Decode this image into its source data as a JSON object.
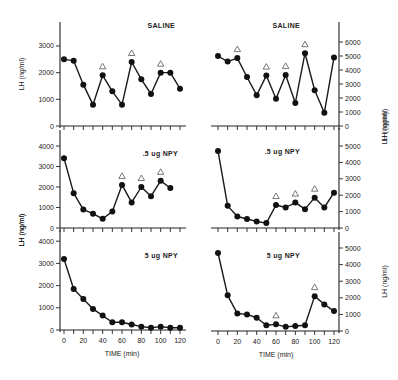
{
  "chart_data": [
    {
      "type": "line",
      "panel": "top-left",
      "label": "SALINE",
      "xlabel": "",
      "ylabel": "LH (ng/ml)",
      "y_axis_side": "left",
      "x": [
        0,
        10,
        20,
        30,
        40,
        50,
        60,
        70,
        80,
        90,
        100,
        110,
        120
      ],
      "values": [
        2500,
        2450,
        1550,
        800,
        1900,
        1300,
        800,
        2400,
        1750,
        1200,
        2000,
        2000,
        1400
      ],
      "pulse_markers_at": [
        40,
        70,
        100
      ],
      "yticks": [
        0,
        1000,
        2000,
        3000
      ],
      "ylim": [
        0,
        3600
      ],
      "xlim": [
        0,
        120
      ]
    },
    {
      "type": "line",
      "panel": "top-right",
      "label": "SALINE",
      "xlabel": "",
      "ylabel": "LH (ng/ml)",
      "y_axis_side": "right",
      "x": [
        0,
        10,
        20,
        30,
        40,
        50,
        60,
        70,
        80,
        90,
        100,
        110,
        120
      ],
      "values": [
        5000,
        4600,
        4850,
        3500,
        2200,
        3600,
        1950,
        3650,
        1650,
        5200,
        2550,
        950,
        4900
      ],
      "pulse_markers_at": [
        20,
        50,
        70,
        90
      ],
      "yticks": [
        0,
        1000,
        2000,
        3000,
        4000,
        5000,
        6000
      ],
      "ylim": [
        0,
        6000
      ],
      "xlim": [
        0,
        120
      ]
    },
    {
      "type": "line",
      "panel": "middle-left",
      "label": ".5 ug NPY",
      "xlabel": "",
      "ylabel": "LH (ng/ml)",
      "y_axis_side": "left",
      "x": [
        0,
        10,
        20,
        30,
        40,
        50,
        60,
        70,
        80,
        90,
        100,
        110
      ],
      "values": [
        3400,
        1700,
        900,
        700,
        450,
        800,
        2100,
        1250,
        2000,
        1550,
        2300,
        1950
      ],
      "pulse_markers_at": [
        60,
        80,
        100
      ],
      "yticks": [
        0,
        1000,
        2000,
        3000,
        4000
      ],
      "ylim": [
        0,
        4500
      ],
      "xlim": [
        0,
        120
      ]
    },
    {
      "type": "line",
      "panel": "middle-right",
      "label": ".5 ug NPY",
      "xlabel": "",
      "ylabel": "LH (ng/ml)",
      "y_axis_side": "right",
      "x": [
        0,
        10,
        20,
        30,
        40,
        50,
        60,
        70,
        80,
        90,
        100,
        110,
        120
      ],
      "values": [
        4700,
        1350,
        700,
        550,
        400,
        300,
        1400,
        1250,
        1550,
        1150,
        1850,
        1250,
        2150
      ],
      "pulse_markers_at": [
        60,
        80,
        100
      ],
      "yticks": [
        0,
        1000,
        2000,
        3000,
        4000,
        5000
      ],
      "ylim": [
        0,
        5500
      ],
      "xlim": [
        0,
        120
      ]
    },
    {
      "type": "line",
      "panel": "bottom-left",
      "label": "5 ug NPY",
      "xlabel": "TIME (min)",
      "ylabel": "LH (ng/ml)",
      "y_axis_side": "left",
      "x": [
        0,
        10,
        20,
        30,
        40,
        50,
        60,
        70,
        80,
        90,
        100,
        110,
        120
      ],
      "values": [
        3200,
        1850,
        1400,
        950,
        650,
        350,
        350,
        250,
        150,
        100,
        150,
        100,
        100
      ],
      "pulse_markers_at": [],
      "yticks": [
        0,
        1000,
        2000,
        3000,
        4000
      ],
      "ylim": [
        0,
        4500
      ],
      "xlim": [
        0,
        120
      ],
      "xticks": [
        0,
        20,
        40,
        60,
        80,
        100,
        120
      ]
    },
    {
      "type": "line",
      "panel": "bottom-right",
      "label": "5 ug NPY",
      "xlabel": "TIME (min)",
      "ylabel": "LH (ng/ml)",
      "y_axis_side": "right",
      "x": [
        0,
        10,
        20,
        30,
        40,
        50,
        60,
        70,
        80,
        90,
        100,
        110,
        120
      ],
      "values": [
        4700,
        2150,
        1050,
        1000,
        800,
        350,
        400,
        250,
        300,
        350,
        2100,
        1600,
        1200
      ],
      "pulse_markers_at": [
        60,
        100
      ],
      "yticks": [
        0,
        1000,
        2000,
        3000,
        4000,
        5000
      ],
      "ylim": [
        0,
        5500
      ],
      "xlim": [
        0,
        120
      ],
      "xticks": [
        0,
        20,
        40,
        60,
        80,
        100,
        120
      ]
    }
  ],
  "layout": {
    "panels": [
      {
        "x0": 64,
        "x1": 180,
        "axis_x": 60,
        "y0": 126,
        "ppu": 0.02667,
        "xaxis_from": 60,
        "xaxis_to": 186
      },
      {
        "x0": 218,
        "x1": 334,
        "axis_x": 339,
        "y0": 126,
        "ppu": 0.014,
        "xaxis_from": 211,
        "xaxis_to": 339
      },
      {
        "x0": 64,
        "x1": 180,
        "axis_x": 60,
        "y0": 228,
        "ppu": 0.0205,
        "xaxis_from": 60,
        "xaxis_to": 186
      },
      {
        "x0": 218,
        "x1": 334,
        "axis_x": 339,
        "y0": 228,
        "ppu": 0.0164,
        "xaxis_from": 211,
        "xaxis_to": 339
      },
      {
        "x0": 64,
        "x1": 180,
        "axis_x": 60,
        "y0": 330,
        "ppu": 0.0222,
        "xaxis_from": 60,
        "xaxis_to": 186
      },
      {
        "x0": 218,
        "x1": 334,
        "axis_x": 339,
        "y0": 331,
        "ppu": 0.0166,
        "xaxis_from": 211,
        "xaxis_to": 339
      }
    ],
    "panel_tops": [
      22,
      130,
      232,
      22,
      130,
      232
    ],
    "label_pos": [
      [
        175,
        28
      ],
      [
        300,
        28
      ],
      [
        178,
        156
      ],
      [
        300,
        154
      ],
      [
        178,
        258
      ],
      [
        300,
        258
      ]
    ],
    "line_color": "#1a1a1a",
    "marker_color": "#111111",
    "pulse_marker_color": "#555555"
  }
}
